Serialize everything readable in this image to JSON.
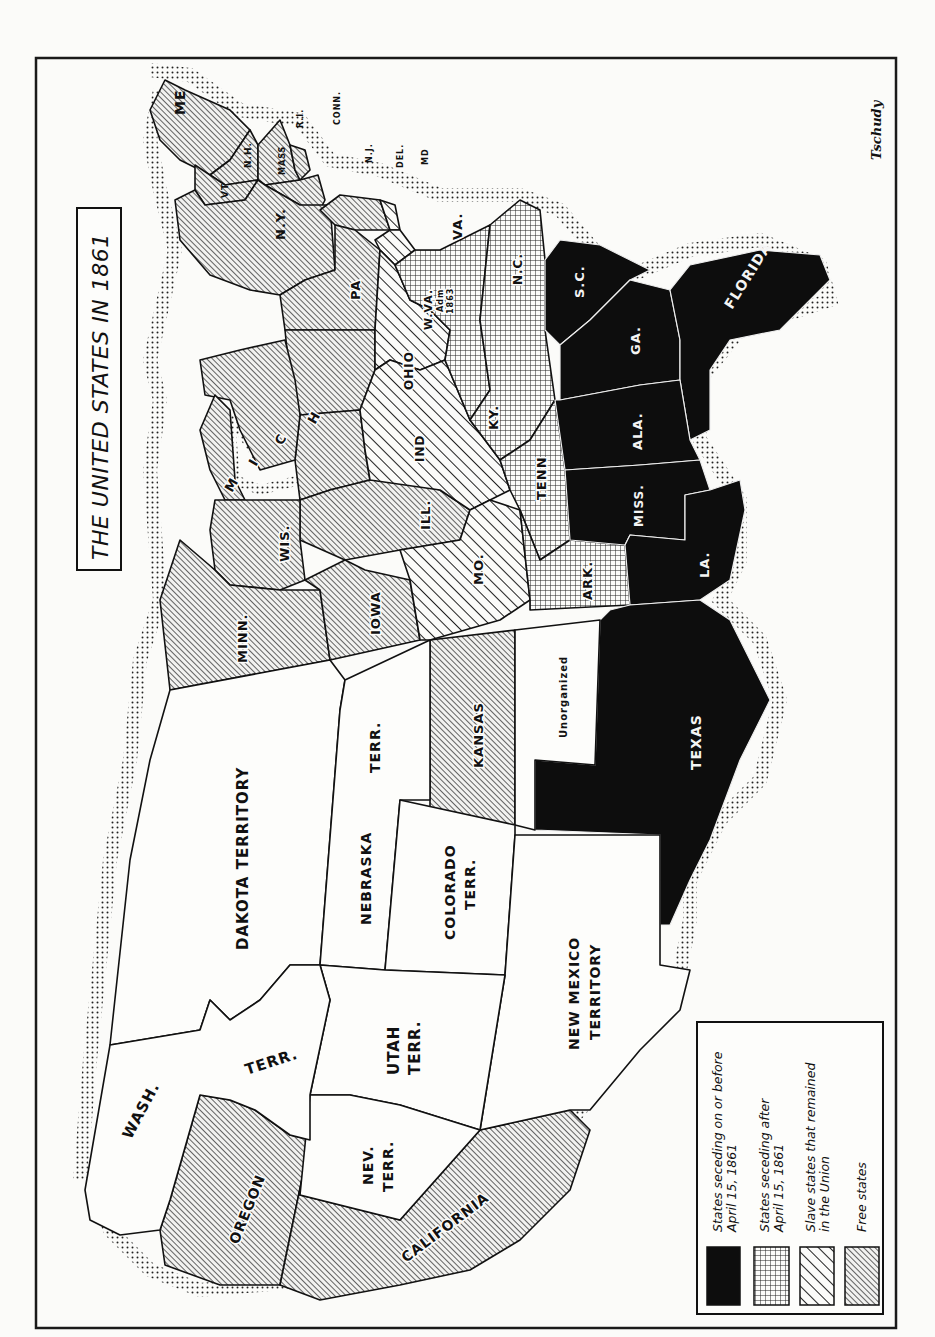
{
  "title": "THE UNITED STATES IN 1861",
  "signature": "Tschudy",
  "orientation": "rotated 90° clockwise (north at left)",
  "colors": {
    "seceded_early": "#0d0d0d",
    "seceded_late_pattern": "grid",
    "slave_union_pattern": "wide-diagonal",
    "free_pattern": "fine-diagonal",
    "territory": "#fdfdfb",
    "ink": "#111111"
  },
  "legend": {
    "items": [
      {
        "key": "seceded-early",
        "line1": "States seceding on or before",
        "line2": "April 15, 1861"
      },
      {
        "key": "seceded-late",
        "line1": "States seceding after",
        "line2": "April 15, 1861"
      },
      {
        "key": "slave-union",
        "line1": "Slave states that remained",
        "line2": "in the Union"
      },
      {
        "key": "free",
        "line1": "Free states",
        "line2": ""
      }
    ]
  },
  "regions": {
    "me": "ME",
    "nh": "N.H.",
    "vt": "VT",
    "mass": "MASS",
    "ri": "R.I.",
    "conn": "CONN.",
    "ny": "N.Y.",
    "nj": "N.J.",
    "del": "DEL.",
    "md": "MD",
    "pa": "PA",
    "ohio": "OHIO",
    "wva": "W.VA.",
    "wva_note1": "Adm",
    "wva_note2": "1863",
    "va": "VA.",
    "nc": "N.C.",
    "sc": "S.C.",
    "ga": "GA.",
    "florida": "FLORIDA",
    "ala": "ALA.",
    "miss": "MISS.",
    "la": "LA.",
    "tenn": "TENN",
    "ky": "KY.",
    "ind": "IND",
    "ill": "ILL.",
    "mich_1": "M",
    "mich_2": "I",
    "mich_3": "C",
    "mich_4": "H",
    "wis": "WIS.",
    "minn": "MINN.",
    "iowa": "IOWA",
    "mo": "MO.",
    "ark": "ARK.",
    "texas": "TEXAS",
    "kansas": "KANSAS",
    "unorganized": "Unorganized",
    "dakota": "DAKOTA TERRITORY",
    "nebraska_1": "NEBRASKA",
    "nebraska_2": "TERR.",
    "colorado_1": "COLORADO",
    "colorado_2": "TERR.",
    "new_mexico_1": "NEW MEXICO",
    "new_mexico_2": "TERRITORY",
    "utah_1": "UTAH",
    "utah_2": "TERR.",
    "nev_1": "NEV.",
    "nev_2": "TERR.",
    "wash_1": "WASH.",
    "wash_2": "TERR.",
    "oregon": "OREGON",
    "california": "CALIFORNIA"
  },
  "classification": {
    "seceded_early": [
      "S.C.",
      "GA.",
      "FLORIDA",
      "ALA.",
      "MISS.",
      "LA.",
      "TEXAS"
    ],
    "seceded_late": [
      "VA.",
      "N.C.",
      "TENN",
      "ARK."
    ],
    "slave_union": [
      "KY.",
      "MO.",
      "MD",
      "DEL.",
      "W.VA."
    ],
    "free": [
      "ME",
      "N.H.",
      "VT",
      "MASS",
      "R.I.",
      "CONN.",
      "N.Y.",
      "N.J.",
      "PA",
      "OHIO",
      "IND",
      "ILL.",
      "MICH",
      "WIS.",
      "MINN.",
      "IOWA",
      "KANSAS",
      "OREGON",
      "CALIFORNIA"
    ],
    "territories": [
      "DAKOTA TERRITORY",
      "NEBRASKA TERR.",
      "COLORADO TERR.",
      "NEW MEXICO TERRITORY",
      "UTAH TERR.",
      "NEV. TERR.",
      "WASH. TERR.",
      "Unorganized"
    ]
  }
}
